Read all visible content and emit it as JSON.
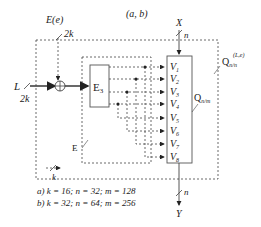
{
  "diagram": {
    "title": "(a, b)",
    "inputs": {
      "L": {
        "label": "L",
        "width": "2k"
      },
      "E": {
        "label": "E(e)",
        "width": "2k"
      },
      "X": {
        "label": "X",
        "width": "n"
      }
    },
    "output": {
      "label": "Y",
      "width": "n"
    },
    "blocks": {
      "e3": {
        "label": "E",
        "sub": "3"
      },
      "qnm": {
        "label": "Q",
        "sub": "n/m"
      },
      "qnn": {
        "label": "Q",
        "sub": "n/n",
        "sup": "(L,e)"
      },
      "e_group": {
        "label": "E"
      }
    },
    "v_inputs": [
      "1",
      "2",
      "3",
      "4",
      "5",
      "6",
      "7",
      "8"
    ],
    "v_prefix": "V",
    "k_bus_label": "k",
    "configs": [
      {
        "tag": "a)",
        "text": "k = 16;  n = 32;  m = 128"
      },
      {
        "tag": "b)",
        "text": "k = 32;  n = 64;  m = 256"
      }
    ]
  }
}
